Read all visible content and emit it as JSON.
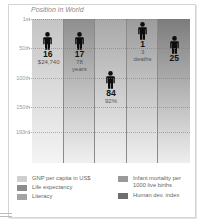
{
  "chart_data": {
    "type": "bar",
    "title": "Position in World",
    "subtitle": "",
    "xlabel": "",
    "ylabel": "",
    "y_axis": {
      "inverted": true,
      "ticks": [
        "1st",
        "50th",
        "100th",
        "150th",
        "193rd"
      ],
      "tick_values": [
        1,
        50,
        100,
        150,
        193
      ],
      "range": [
        1,
        193
      ]
    },
    "grid": true,
    "legend_position": "bottom",
    "categories": [
      "GNP per capita in US$",
      "Life expectancy",
      "Literacy",
      "Infant mortality per 1000 live births",
      "Human dev. index"
    ],
    "values": [
      16,
      17,
      84,
      1,
      25
    ],
    "value_labels": [
      "16",
      "17",
      "84",
      "1",
      "25"
    ],
    "annotations": [
      "$24,740",
      "78 years",
      "92%",
      "3 deaths",
      ""
    ],
    "colors": [
      "#d6d6d6",
      "#9e9e9e",
      "#b9b9b9",
      "#acacac",
      "#8a8a8a"
    ]
  },
  "title": "Position in World",
  "y_ticks": [
    {
      "label": "1st",
      "y": 19
    },
    {
      "label": "50th",
      "y": 48
    },
    {
      "label": "100th",
      "y": 78
    },
    {
      "label": "150th",
      "y": 107
    },
    {
      "label": "193rd",
      "y": 132
    }
  ],
  "columns": [
    {
      "rank": "16",
      "line1": "$24,740",
      "line2": "",
      "color_top": "#c4c4c4",
      "color_bottom": "#f4f4f4",
      "fig_top": 30
    },
    {
      "rank": "17",
      "line1": "78",
      "line2": "years",
      "color_top": "#8e8e8e",
      "color_bottom": "#f0f0f0",
      "fig_top": 30
    },
    {
      "rank": "84",
      "line1": "92%",
      "line2": "",
      "color_top": "#a8a8a8",
      "color_bottom": "#f2f2f2",
      "fig_top": 69
    },
    {
      "rank": "1",
      "line1": "3",
      "line2": "deaths",
      "color_top": "#9c9c9c",
      "color_bottom": "#f0f0f0",
      "fig_top": 20
    },
    {
      "rank": "25",
      "line1": "",
      "line2": "",
      "color_top": "#7c7c7c",
      "color_bottom": "#eeeeee",
      "fig_top": 34
    }
  ],
  "legend": {
    "left": [
      {
        "label": "GNP per capita in US$",
        "color": "#cfcfcf"
      },
      {
        "label": "Life expectancy",
        "color": "#8c8c8c"
      },
      {
        "label": "Literacy",
        "color": "#a4a4a4"
      }
    ],
    "right": [
      {
        "label": "Infant mortality per",
        "label2": "1000 live births",
        "color": "#9a9a9a"
      },
      {
        "label": "Human dev. index",
        "color": "#6e6e6e"
      }
    ]
  }
}
